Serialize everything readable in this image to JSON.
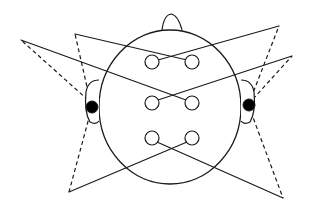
{
  "diagram": {
    "title": "",
    "colors": {
      "stroke": "#1a1a1a",
      "background": "#ffffff",
      "reference_fill": "#000000"
    },
    "head": {
      "cx": 170,
      "cy": 107,
      "rx": 71,
      "ry": 77
    },
    "nose": {
      "path": "M162 30 Q164 15 171 14 Q178 15 182 30"
    },
    "ears": [
      {
        "side": "left",
        "path": "M99 80 Q88 80 86 92 Q84 112 90 122 Q96 125 99 121"
      },
      {
        "side": "right",
        "path": "M241 80 Q252 80 254 92 Q256 112 250 122 Q244 125 241 121"
      }
    ],
    "electrodes": [
      {
        "id": "L1",
        "x": 152,
        "y": 62,
        "r": 7
      },
      {
        "id": "R1",
        "x": 192,
        "y": 62,
        "r": 7
      },
      {
        "id": "L2",
        "x": 152,
        "y": 103,
        "r": 7
      },
      {
        "id": "R2",
        "x": 192,
        "y": 103,
        "r": 7
      },
      {
        "id": "L3",
        "x": 152,
        "y": 138,
        "r": 7
      },
      {
        "id": "R3",
        "x": 192,
        "y": 138,
        "r": 7
      }
    ],
    "reference_electrodes": [
      {
        "id": "ref-left",
        "x": 92,
        "y": 107,
        "r": 6
      },
      {
        "id": "ref-right",
        "x": 249,
        "y": 105,
        "r": 6
      }
    ],
    "vertices": {
      "A": {
        "x": 21,
        "y": 40
      },
      "B": {
        "x": 75,
        "y": 34
      },
      "C": {
        "x": 279,
        "y": 26
      },
      "D": {
        "x": 292,
        "y": 56
      },
      "E": {
        "x": 69,
        "y": 192
      },
      "F": {
        "x": 283,
        "y": 198
      }
    },
    "solid_lines": [
      {
        "from": "B",
        "to": "R1",
        "x1": 75,
        "y1": 34,
        "x2": 187,
        "y2": 60
      },
      {
        "from": "C",
        "to": "L1",
        "x1": 279,
        "y1": 26,
        "x2": 158,
        "y2": 60
      },
      {
        "from": "A",
        "to": "R2",
        "x1": 21,
        "y1": 40,
        "x2": 186,
        "y2": 100
      },
      {
        "from": "D",
        "to": "L2",
        "x1": 292,
        "y1": 56,
        "x2": 158,
        "y2": 100
      },
      {
        "from": "E",
        "to": "R3",
        "x1": 69,
        "y1": 192,
        "x2": 187,
        "y2": 142
      },
      {
        "from": "F",
        "to": "L3",
        "x1": 283,
        "y1": 198,
        "x2": 157,
        "y2": 142
      }
    ],
    "dashed_lines": [
      {
        "from": "ref-left",
        "to": "A",
        "x1": 88,
        "y1": 100,
        "x2": 21,
        "y2": 40
      },
      {
        "from": "ref-left",
        "to": "B",
        "x1": 90,
        "y1": 100,
        "x2": 75,
        "y2": 34
      },
      {
        "from": "ref-left",
        "to": "E",
        "x1": 90,
        "y1": 114,
        "x2": 69,
        "y2": 192
      },
      {
        "from": "ref-right",
        "to": "C",
        "x1": 251,
        "y1": 98,
        "x2": 279,
        "y2": 26
      },
      {
        "from": "ref-right",
        "to": "D",
        "x1": 253,
        "y1": 99,
        "x2": 292,
        "y2": 56
      },
      {
        "from": "ref-right",
        "to": "F",
        "x1": 251,
        "y1": 112,
        "x2": 283,
        "y2": 198
      }
    ]
  }
}
